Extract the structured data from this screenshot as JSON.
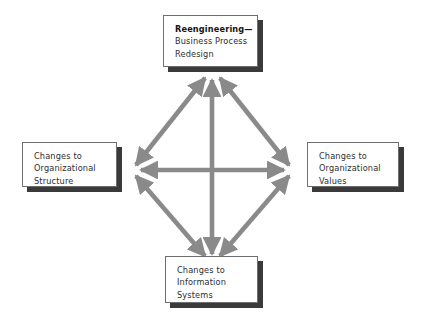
{
  "diagram": {
    "background_color": "#ffffff",
    "arrow_color": "#8a8a8a",
    "box_fill_color": "#ffffff",
    "box_border_color": "#6e6e6e",
    "box_shadow_color": "#3a3a3a",
    "text_color": "#2e2e2e"
  },
  "nodes": {
    "reengineering": {
      "lines": [
        "Reengineering—",
        "Business Process",
        "Redesign"
      ],
      "bold_first_line": true,
      "position": "top"
    },
    "structure": {
      "lines": [
        "Changes to",
        "Organizational",
        "Structure"
      ],
      "bold_first_line": false,
      "position": "left"
    },
    "values": {
      "lines": [
        "Changes to",
        "Organizational",
        "Values"
      ],
      "bold_first_line": false,
      "position": "right"
    },
    "information": {
      "lines": [
        "Changes to",
        "Information",
        "Systems"
      ],
      "bold_first_line": false,
      "position": "bottom"
    }
  },
  "connectors": [
    {
      "name": "reengineering-to-information",
      "from": "reengineering",
      "to": "information",
      "style": "double-headed",
      "orientation": "vertical"
    },
    {
      "name": "structure-to-values",
      "from": "structure",
      "to": "values",
      "style": "double-headed",
      "orientation": "horizontal"
    },
    {
      "name": "reengineering-to-structure",
      "from": "reengineering",
      "to": "structure",
      "style": "double-headed",
      "orientation": "diagonal"
    },
    {
      "name": "reengineering-to-values",
      "from": "reengineering",
      "to": "values",
      "style": "double-headed",
      "orientation": "diagonal"
    },
    {
      "name": "structure-to-information",
      "from": "structure",
      "to": "information",
      "style": "double-headed",
      "orientation": "diagonal"
    },
    {
      "name": "values-to-information",
      "from": "values",
      "to": "information",
      "style": "double-headed",
      "orientation": "diagonal"
    }
  ]
}
